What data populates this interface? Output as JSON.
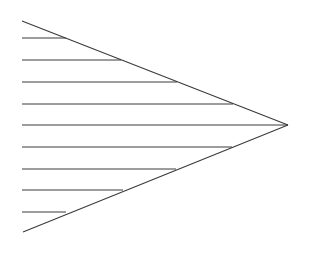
{
  "figure": {
    "type": "line-diagram",
    "canvas": {
      "width": 312,
      "height": 258,
      "background_color": "#ffffff"
    },
    "style": {
      "stroke_color": "#3a3a3a",
      "stroke_width": 1,
      "diagonal_stroke_color": "#3a3a3a",
      "diagonal_stroke_width": 1.1
    },
    "apex": {
      "label": "apex",
      "x": 288,
      "y": 125
    },
    "wedge": {
      "top_vertex": {
        "x": 22,
        "y": 21
      },
      "bottom_vertex": {
        "x": 23,
        "y": 232
      },
      "opening_side": "left",
      "axis_of_symmetry_y": 125
    },
    "left_margin_x": 22,
    "horizontal_lines": [
      {
        "index": 1,
        "y": 38,
        "x_start": 22,
        "x_end": 66
      },
      {
        "index": 2,
        "y": 60,
        "x_start": 22,
        "x_end": 121
      },
      {
        "index": 3,
        "y": 82,
        "x_start": 22,
        "x_end": 177
      },
      {
        "index": 4,
        "y": 104,
        "x_start": 22,
        "x_end": 233
      },
      {
        "index": 5,
        "y": 125,
        "x_start": 22,
        "x_end": 288
      },
      {
        "index": 6,
        "y": 147,
        "x_start": 22,
        "x_end": 232
      },
      {
        "index": 7,
        "y": 169,
        "x_start": 22,
        "x_end": 176
      },
      {
        "index": 8,
        "y": 190,
        "x_start": 22,
        "x_end": 123
      },
      {
        "index": 9,
        "y": 212,
        "x_start": 22,
        "x_end": 66
      }
    ],
    "counts": {
      "horizontal_lines": 9,
      "diagonal_lines": 2,
      "total_strokes": 11
    }
  }
}
